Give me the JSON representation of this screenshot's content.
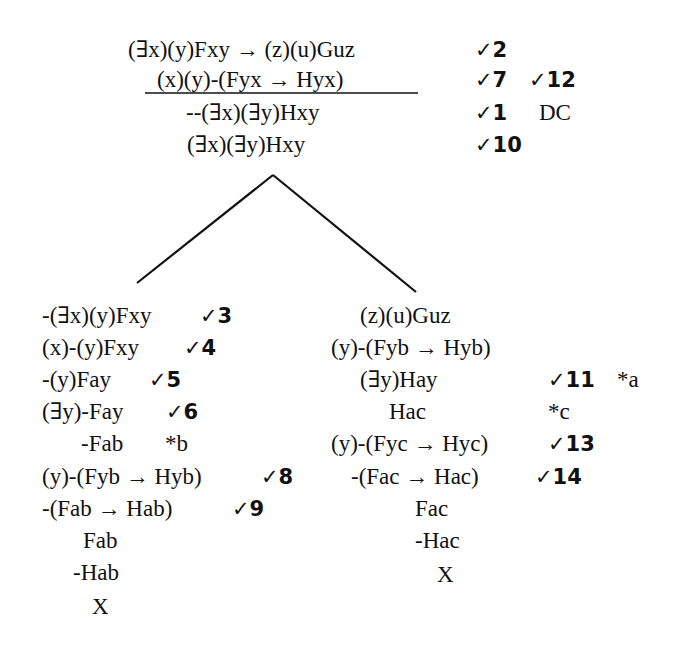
{
  "trunk": {
    "premises": [
      {
        "formula": "(∃x)(y)Fxy → (z)(u)Guz",
        "annotation": "✓2"
      },
      {
        "formula": "(x)(y)-(Fyx → Hyx)",
        "annotation": "✓7",
        "annotation2": "✓12"
      },
      {
        "formula": "--(∃x)(∃y)Hxy",
        "annotation": "✓1",
        "annotation2": "DC"
      },
      {
        "formula": "(∃x)(∃y)Hxy",
        "annotation": "✓10"
      }
    ]
  },
  "left_branch": {
    "rows": [
      {
        "formula": "-(∃x)(y)Fxy",
        "annotation": "✓3"
      },
      {
        "formula": "(x)-(y)Fxy",
        "annotation": "✓4"
      },
      {
        "formula": "-(y)Fay",
        "annotation": "✓5"
      },
      {
        "formula": "(∃y)-Fay",
        "annotation": "✓6"
      },
      {
        "formula": "-Fab",
        "annotation": "*b"
      },
      {
        "formula": "(y)-(Fyb → Hyb)",
        "annotation": "✓8"
      },
      {
        "formula": "-(Fab → Hab)",
        "annotation": "✓9"
      },
      {
        "formula": "Fab",
        "annotation": ""
      },
      {
        "formula": "-Hab",
        "annotation": ""
      },
      {
        "formula": "X",
        "annotation": ""
      }
    ]
  },
  "right_branch": {
    "rows": [
      {
        "formula": "(z)(u)Guz",
        "annotation": ""
      },
      {
        "formula": "(y)-(Fyb → Hyb)",
        "annotation": ""
      },
      {
        "formula": "(∃y)Hay",
        "annotation": "✓11",
        "annotation2": "*a"
      },
      {
        "formula": "Hac",
        "annotation": "*c"
      },
      {
        "formula": "(y)-(Fyc → Hyc)",
        "annotation": "✓13"
      },
      {
        "formula": "-(Fac → Hac)",
        "annotation": "✓14"
      },
      {
        "formula": "Fac",
        "annotation": ""
      },
      {
        "formula": "-Hac",
        "annotation": ""
      },
      {
        "formula": "X",
        "annotation": ""
      }
    ]
  }
}
